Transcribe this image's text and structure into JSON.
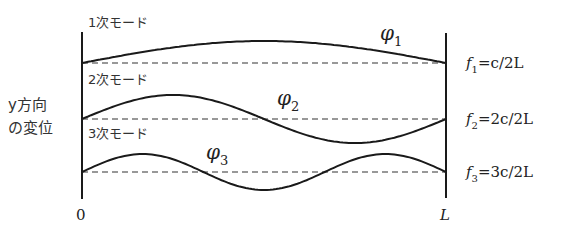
{
  "diagram": {
    "y_axis_label_line1": "y方向",
    "y_axis_label_line2": "の変位",
    "x_start_label": "0",
    "x_end_label": "L",
    "modes": [
      {
        "order": 1,
        "label": "1次モード",
        "phi_symbol": "φ",
        "phi_subscript": "1",
        "freq_f": "f",
        "freq_subscript": "1",
        "freq_formula": "=c/2L",
        "half_wavelengths": 1
      },
      {
        "order": 2,
        "label": "2次モード",
        "phi_symbol": "φ",
        "phi_subscript": "2",
        "freq_f": "f",
        "freq_subscript": "2",
        "freq_formula": "=2c/2L",
        "half_wavelengths": 2
      },
      {
        "order": 3,
        "label": "3次モード",
        "phi_symbol": "φ",
        "phi_subscript": "3",
        "freq_f": "f",
        "freq_subscript": "3",
        "freq_formula": "=3c/2L",
        "half_wavelengths": 3
      }
    ],
    "colors": {
      "line": "#1a1a1a",
      "text": "#222222"
    }
  }
}
